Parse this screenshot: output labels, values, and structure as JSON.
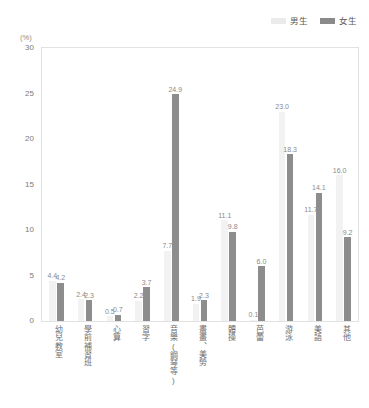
{
  "legend": {
    "position": "top-right",
    "entries": [
      {
        "label": "男生",
        "color": "#f2f2f2",
        "name": "boys"
      },
      {
        "label": "女生",
        "color": "#8d8d8d",
        "name": "girls"
      }
    ]
  },
  "axis": {
    "unit_label": "(%)",
    "y_ticks": [
      "0",
      "5",
      "10",
      "15",
      "20",
      "25",
      "30"
    ]
  },
  "chart_data": {
    "type": "bar",
    "title": "",
    "subtitle": "",
    "xlabel": "",
    "ylabel": "(%)",
    "ylim": [
      0,
      30
    ],
    "ytick_step": 5,
    "grid": false,
    "legend_position": "top-right",
    "categories": [
      "幼兒教室",
      "學前補習班",
      "心算",
      "習字",
      "音樂(鋼琴等)",
      "畫畫、美勞",
      "體操",
      "芭蕾",
      "游泳",
      "美語",
      "其他"
    ],
    "series": [
      {
        "name": "男生",
        "color": "#f2f2f2",
        "values": [
          4.4,
          2.4,
          0.5,
          2.2,
          7.7,
          1.9,
          11.1,
          0.1,
          23.0,
          11.7,
          16.0
        ],
        "labels": [
          "4.4",
          "2.4",
          "0.5",
          "2.2",
          "7.7",
          "1.9",
          "11.1",
          "0.1",
          "23.0",
          "11.7",
          "16.0"
        ]
      },
      {
        "name": "女生",
        "color": "#8d8d8d",
        "values": [
          4.2,
          2.3,
          0.7,
          3.7,
          24.9,
          2.3,
          9.8,
          6.0,
          18.3,
          14.1,
          9.2
        ],
        "labels": [
          "4.2",
          "2.3",
          "0.7",
          "3.7",
          "24.9",
          "2.3",
          "9.8",
          "6.0",
          "18.3",
          "14.1",
          "9.2"
        ]
      }
    ]
  }
}
